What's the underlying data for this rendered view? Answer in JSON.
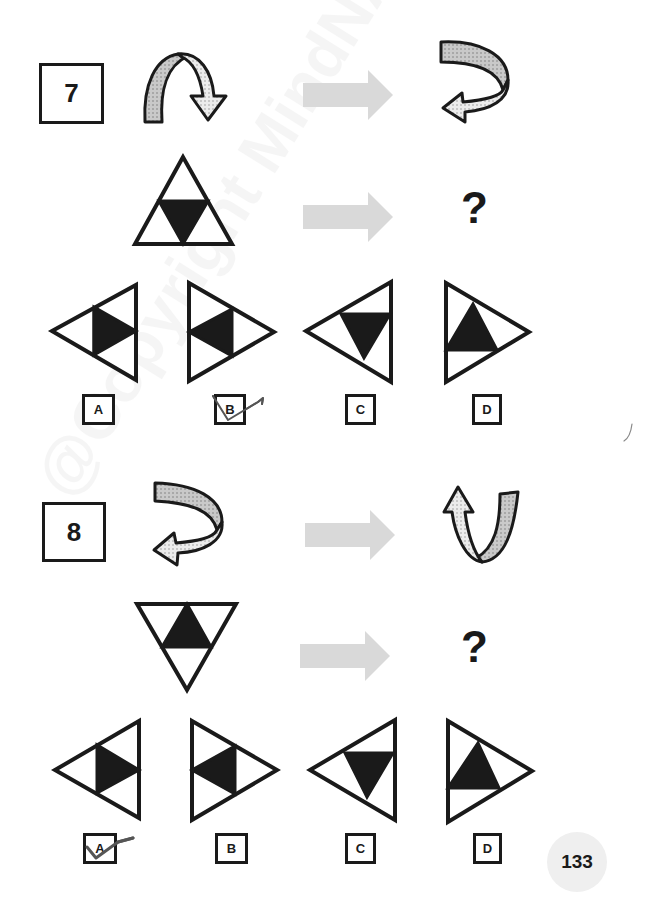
{
  "watermark": "@Copyright MindNA",
  "questions": [
    {
      "number": "7",
      "example_relation": "curved arrow arcing over to the right, pointing down  →  curved arrow turning back, pointing left",
      "problem": "upright triangle with inverted black inner triangle  →  ?",
      "question_mark": "?",
      "options": [
        {
          "label": "A",
          "figure": "left-pointing triangle with black inner triangle pointing right",
          "marked": false
        },
        {
          "label": "B",
          "figure": "right-pointing triangle with black inner triangle pointing left",
          "marked": true
        },
        {
          "label": "C",
          "figure": "left-pointing triangle with black inner triangle pointing down",
          "marked": false
        },
        {
          "label": "D",
          "figure": "right-pointing triangle with black inner triangle pointing up",
          "marked": false
        }
      ]
    },
    {
      "number": "8",
      "example_relation": "curved arrow turning back, pointing left  →  U-shaped arrow pointing up",
      "problem": "inverted triangle with upright black inner triangle  →  ?",
      "question_mark": "?",
      "options": [
        {
          "label": "A",
          "figure": "left-pointing triangle with black inner triangle pointing right",
          "marked": true
        },
        {
          "label": "B",
          "figure": "right-pointing triangle with black inner triangle pointing left",
          "marked": false
        },
        {
          "label": "C",
          "figure": "left-pointing triangle with black inner triangle pointing down",
          "marked": false
        },
        {
          "label": "D",
          "figure": "right-pointing triangle with black inner triangle pointing up",
          "marked": false
        }
      ]
    }
  ],
  "page_number": "133",
  "colors": {
    "ink": "#1a1a1a",
    "transform_arrow": "#d9d9d9",
    "ribbon_dark": "#c8c8c8",
    "ribbon_light": "#eeeeee",
    "check_mark": "#555555",
    "page_circle": "#efefef"
  }
}
